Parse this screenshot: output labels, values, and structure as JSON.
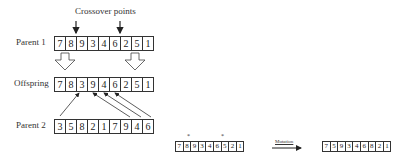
{
  "crossover": {
    "title": "Crossover points",
    "parent1": {
      "label": "Parent 1",
      "genes": [
        "7",
        "8",
        "9",
        "3",
        "4",
        "6",
        "2",
        "5",
        "1"
      ]
    },
    "offspring": {
      "label": "Offspring",
      "genes": [
        "7",
        "8",
        "3",
        "9",
        "4",
        "6",
        "2",
        "5",
        "1"
      ]
    },
    "parent2": {
      "label": "Parent 2",
      "genes": [
        "3",
        "5",
        "8",
        "2",
        "1",
        "7",
        "9",
        "4",
        "6"
      ]
    }
  },
  "mutation": {
    "label": "Mutation",
    "marker": "*",
    "before": {
      "genes": [
        "7",
        "8",
        "9",
        "3",
        "4",
        "6",
        "5",
        "2",
        "1"
      ],
      "marked_positions": [
        2,
        7
      ]
    },
    "after": {
      "genes": [
        "7",
        "5",
        "9",
        "3",
        "4",
        "6",
        "8",
        "2",
        "1"
      ]
    }
  }
}
